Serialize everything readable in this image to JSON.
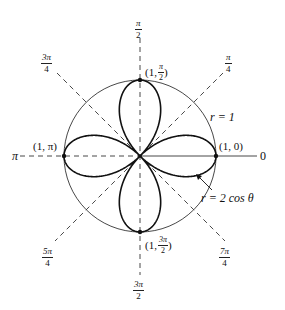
{
  "figure": {
    "type": "polar-graph",
    "curve_label": "r = 2 cos θ",
    "circle_label": "r = 1",
    "colors": {
      "curve": "#111111",
      "circle": "#333333",
      "axes": "#333333",
      "background": "#ffffff"
    }
  },
  "angle_labels": {
    "a0": "0",
    "a45": {
      "num": "π",
      "den": "4"
    },
    "a90": {
      "num": "π",
      "den": "2"
    },
    "a135": {
      "num": "3π",
      "den": "4"
    },
    "a180": "π",
    "a225": {
      "num": "5π",
      "den": "4"
    },
    "a270": {
      "num": "3π",
      "den": "2"
    },
    "a315": {
      "num": "7π",
      "den": "4"
    }
  },
  "points": {
    "p0": "(1, 0)",
    "p90": {
      "prefix": "(1,",
      "num": "π",
      "den": "2",
      "suffix": ")"
    },
    "p180": "(1, π)",
    "p270": {
      "prefix": "(1,",
      "num": "3π",
      "den": "2",
      "suffix": ")"
    }
  },
  "labels": {
    "r_equals_1": "r = 1",
    "curve_equation": "r = 2 cos θ"
  }
}
